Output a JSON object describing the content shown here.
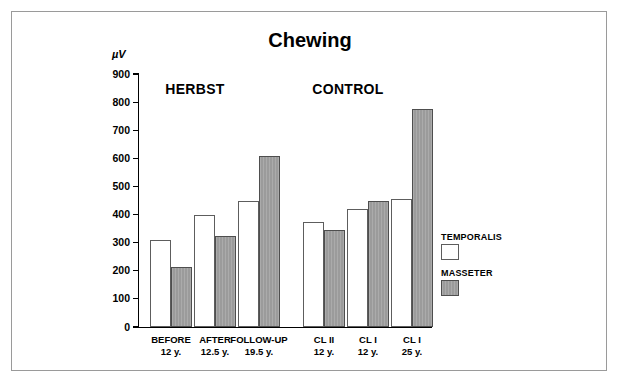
{
  "figure": {
    "title": "Chewing",
    "unit_label": "µV"
  },
  "chart_data": {
    "type": "bar",
    "title": "Chewing",
    "xlabel": "",
    "ylabel": "µV",
    "ylim": [
      0,
      900
    ],
    "ytick_values": [
      0,
      100,
      200,
      300,
      400,
      500,
      600,
      700,
      800,
      900
    ],
    "ytick_labels": [
      "0",
      "100",
      "200",
      "300",
      "400",
      "500",
      "600",
      "700",
      "800",
      "900"
    ],
    "grid": false,
    "legend_position": "right",
    "groups": [
      {
        "name": "HERBST",
        "categories": [
          0,
          1,
          2
        ]
      },
      {
        "name": "CONTROL",
        "categories": [
          3,
          4,
          5
        ]
      }
    ],
    "categories": [
      {
        "line1": "BEFORE",
        "line2": "12 y."
      },
      {
        "line1": "AFTER",
        "line2": "12.5 y."
      },
      {
        "line1": "FOLLOW-UP",
        "line2": "19.5 y."
      },
      {
        "line1": "CL II",
        "line2": "12 y."
      },
      {
        "line1": "CL I",
        "line2": "12 y."
      },
      {
        "line1": "CL I",
        "line2": "25 y."
      }
    ],
    "series": [
      {
        "name": "TEMPORALIS",
        "color": "#ffffff",
        "values": [
          310,
          400,
          450,
          375,
          420,
          455
        ]
      },
      {
        "name": "MASSETER",
        "color": "#9b9b9b",
        "values": [
          215,
          325,
          610,
          345,
          450,
          775
        ]
      }
    ]
  },
  "legend": {
    "entries": [
      {
        "label": "TEMPORALIS",
        "swatch": "white"
      },
      {
        "label": "MASSETER",
        "swatch": "gray"
      }
    ]
  }
}
